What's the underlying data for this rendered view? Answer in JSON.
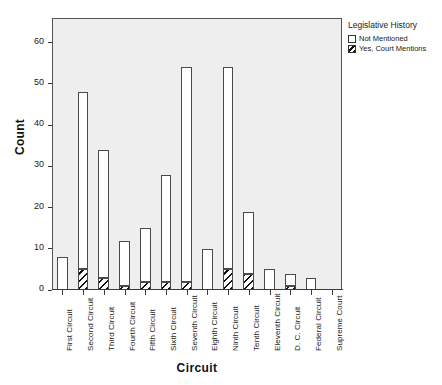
{
  "chart_data": {
    "type": "bar",
    "subtype": "stacked",
    "title": "",
    "xlabel": "Circuit",
    "ylabel": "Count",
    "ylim": [
      0,
      66
    ],
    "yticks": [
      0,
      10,
      20,
      30,
      40,
      50,
      60
    ],
    "grid": false,
    "legend_position": "top-right",
    "legend_title": "Legislative History",
    "categories": [
      "First Circuit",
      "Second Circuit",
      "Third Circuit",
      "Fourth Circuit",
      "Fifth Circuit",
      "Sixth Circuit",
      "Seventh Circuit",
      "Eighth Circuit",
      "Ninth Circuit",
      "Tenth Circuit",
      "Eleventh Circuit",
      "D. C. Circuit",
      "Federal Circuit",
      "Supreme Court"
    ],
    "series": [
      {
        "name": "Yes, Court Mentions",
        "fill": "hatch",
        "values": [
          0,
          5,
          3,
          1,
          2,
          2,
          2,
          0,
          5,
          4,
          0,
          1,
          0,
          0
        ]
      },
      {
        "name": "Not Mentioned",
        "fill": "plain",
        "values": [
          8,
          43,
          31,
          11,
          13,
          26,
          52,
          10,
          49,
          15,
          5,
          3,
          3,
          0
        ]
      }
    ],
    "totals": [
      8,
      48,
      34,
      12,
      15,
      28,
      54,
      10,
      54,
      19,
      5,
      4,
      3,
      0
    ]
  },
  "legend": {
    "title": "Legislative History",
    "items": [
      {
        "label": "Not Mentioned",
        "fill": "plain"
      },
      {
        "label": "Yes, Court Mentions",
        "fill": "hatch"
      }
    ]
  },
  "axes": {
    "y_title": "Count",
    "x_title": "Circuit",
    "y_tick_labels": [
      "0",
      "10",
      "20",
      "30",
      "40",
      "50",
      "60"
    ]
  },
  "colors": {
    "plot_background": "#eeeeee",
    "page_background": "#ffffff",
    "frame_border": "#555555",
    "bar_outline": "#4a4a4a",
    "bar_plain_fill": "#ffffff",
    "hatch_stroke": "#101010",
    "text": "#1a1a1a"
  }
}
